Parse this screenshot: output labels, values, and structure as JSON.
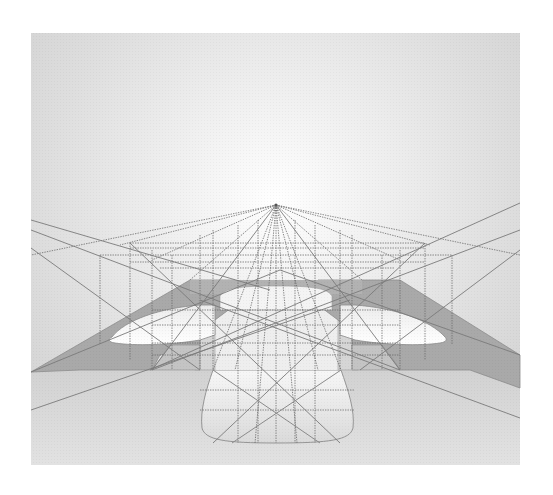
{
  "figure": {
    "type": "perspective-drawing",
    "panel": {
      "x": 31,
      "y": 33,
      "width": 489,
      "height": 432
    },
    "vanishing_point": {
      "x": 276,
      "y": 205
    },
    "colors": {
      "background": "#ffffff",
      "panel_top": "#dcdcdc",
      "panel_glow": "#ffffff",
      "ledge": "#a9a9a9",
      "guide_line": "#6a6a6a",
      "floor": "#d2d2d2"
    },
    "elements": [
      {
        "name": "vanishing-point",
        "label": ""
      },
      {
        "name": "left-ledge",
        "label": ""
      },
      {
        "name": "right-ledge",
        "label": ""
      },
      {
        "name": "central-bay",
        "label": ""
      },
      {
        "name": "front-projection",
        "label": ""
      }
    ]
  }
}
